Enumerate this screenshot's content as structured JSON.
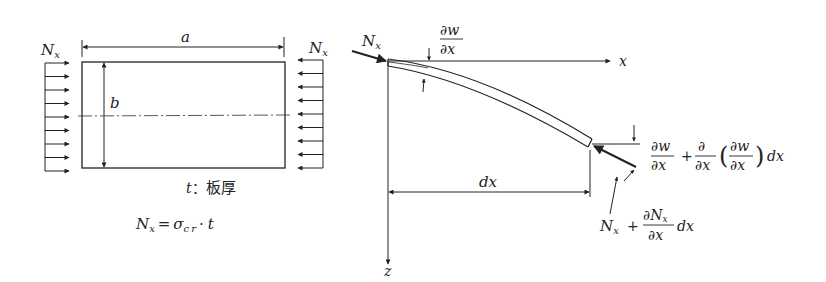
{
  "left_figure": {
    "title": "rectangular plate under uniform compression",
    "load_label_left": "N",
    "load_label_left_sub": "x",
    "load_label_right": "N",
    "load_label_right_sub": "x",
    "dim_a": "a",
    "dim_b": "b",
    "thickness_var": "t",
    "thickness_sep": "：",
    "thickness_desc": "板厚",
    "formula": {
      "lhs": "N",
      "lhs_sub": "x",
      "eq": "=",
      "sigma": "σ",
      "sigma_sub": "cr",
      "dot": "·",
      "t": "t"
    },
    "arrow_count": 9
  },
  "right_figure": {
    "title": "deflected plate element",
    "load_label": "N",
    "load_label_sub": "x",
    "axis_x": "x",
    "axis_z": "z",
    "dx_label": "dx",
    "slope_top": {
      "num": "∂w",
      "den": "∂x"
    },
    "slope_end": {
      "t1_num": "∂w",
      "t1_den": "∂x",
      "plus": "+",
      "t2_num": "∂",
      "t2_den": "∂x",
      "paren_num": "∂w",
      "paren_den": "∂x",
      "lparen": "(",
      "rparen": ")",
      "tail": "dx"
    },
    "force_end": {
      "n": "N",
      "n_sub": "x",
      "plus": "+",
      "num": "∂N",
      "num_sub": "x",
      "den": "∂x",
      "tail": "dx"
    }
  }
}
